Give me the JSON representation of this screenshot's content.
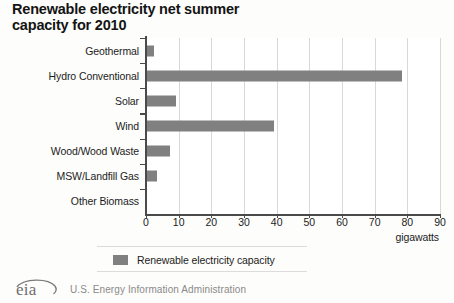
{
  "chart_data": {
    "type": "bar",
    "orientation": "horizontal",
    "title": "Renewable electricity net summer capacity for 2010",
    "title_lines": [
      "Renewable electricity net summer",
      "capacity for 2010"
    ],
    "categories": [
      "Geothermal",
      "Hydro Conventional",
      "Solar",
      "Wind",
      "Wood/Wood Waste",
      "MSW/Landfill Gas",
      "Other Biomass"
    ],
    "values": [
      2,
      78,
      9,
      39,
      7,
      3,
      0
    ],
    "series": [
      {
        "name": "Renewable electricity capacity",
        "values": [
          2,
          78,
          9,
          39,
          7,
          3,
          0
        ]
      }
    ],
    "xlabel": "gigawatts",
    "ylabel": "",
    "xlim": [
      0,
      90
    ],
    "xticks": [
      0,
      10,
      20,
      30,
      40,
      50,
      60,
      70,
      80,
      90
    ],
    "xtick_labels": [
      "0",
      "10",
      "20",
      "30",
      "40",
      "50",
      "60",
      "70",
      "80",
      "90"
    ],
    "grid": "vertical",
    "legend": {
      "position": "bottom",
      "entries": [
        {
          "label": "Renewable electricity capacity",
          "color": "#808080"
        }
      ]
    }
  },
  "colors": {
    "bar": "#808080",
    "gridline": "#d8d8d8",
    "axis": "#4a4a4a",
    "background": "#fdfdfb",
    "plot_background": "#ffffff",
    "title_text": "#141414",
    "footer_text": "#8a8a8a"
  },
  "footer": {
    "logo_text": "eia",
    "agency": "U.S. Energy Information Administration"
  }
}
